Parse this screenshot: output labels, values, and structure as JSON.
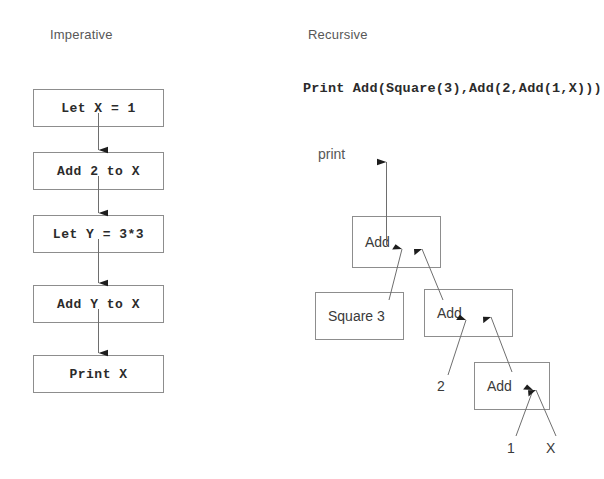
{
  "figure": {
    "columns": [
      {
        "key": "imperative",
        "title": "Imperative"
      },
      {
        "key": "recursive",
        "title": "Recursive"
      }
    ]
  },
  "imperative": {
    "title": "Imperative",
    "steps": [
      {
        "label": "Let X = 1"
      },
      {
        "label": "Add 2 to X"
      },
      {
        "label": "Let Y = 3*3"
      },
      {
        "label": "Add Y to X"
      },
      {
        "label": "Print X"
      }
    ]
  },
  "recursive": {
    "title": "Recursive",
    "expression": "Print Add(Square(3),Add(2,Add(1,X)))",
    "output_label": "print",
    "nodes": [
      {
        "id": "root_add",
        "label": "Add"
      },
      {
        "id": "square3",
        "label": "Square 3"
      },
      {
        "id": "add_mid",
        "label": "Add"
      },
      {
        "id": "add_low",
        "label": "Add"
      }
    ],
    "leaves": [
      {
        "id": "two",
        "label": "2"
      },
      {
        "id": "one",
        "label": "1"
      },
      {
        "id": "ex",
        "label": "X"
      }
    ]
  },
  "colors": {
    "box_border": "#8d8d8d",
    "text_dark": "#2b2b2b",
    "text_gray": "#575757",
    "line": "#6e6e6e",
    "background": "#ffffff"
  }
}
